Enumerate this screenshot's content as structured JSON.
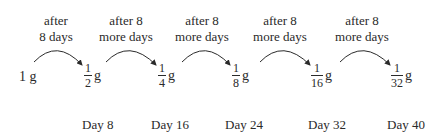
{
  "captions": [
    {
      "line1": "after",
      "line2": "8 days"
    },
    {
      "line1": "after 8",
      "line2": "more days"
    },
    {
      "line1": "after 8",
      "line2": "more days"
    },
    {
      "line1": "after 8",
      "line2": "more days"
    },
    {
      "line1": "after 8",
      "line2": "more days"
    }
  ],
  "start_amount": "1 g",
  "amounts": [
    {
      "num": "1",
      "den": "2",
      "unit": "g"
    },
    {
      "num": "1",
      "den": "4",
      "unit": "g"
    },
    {
      "num": "1",
      "den": "8",
      "unit": "g"
    },
    {
      "num": "1",
      "den": "16",
      "unit": "g"
    },
    {
      "num": "1",
      "den": "32",
      "unit": "g"
    }
  ],
  "days": [
    "Day 8",
    "Day 16",
    "Day 24",
    "Day 32",
    "Day 40"
  ]
}
